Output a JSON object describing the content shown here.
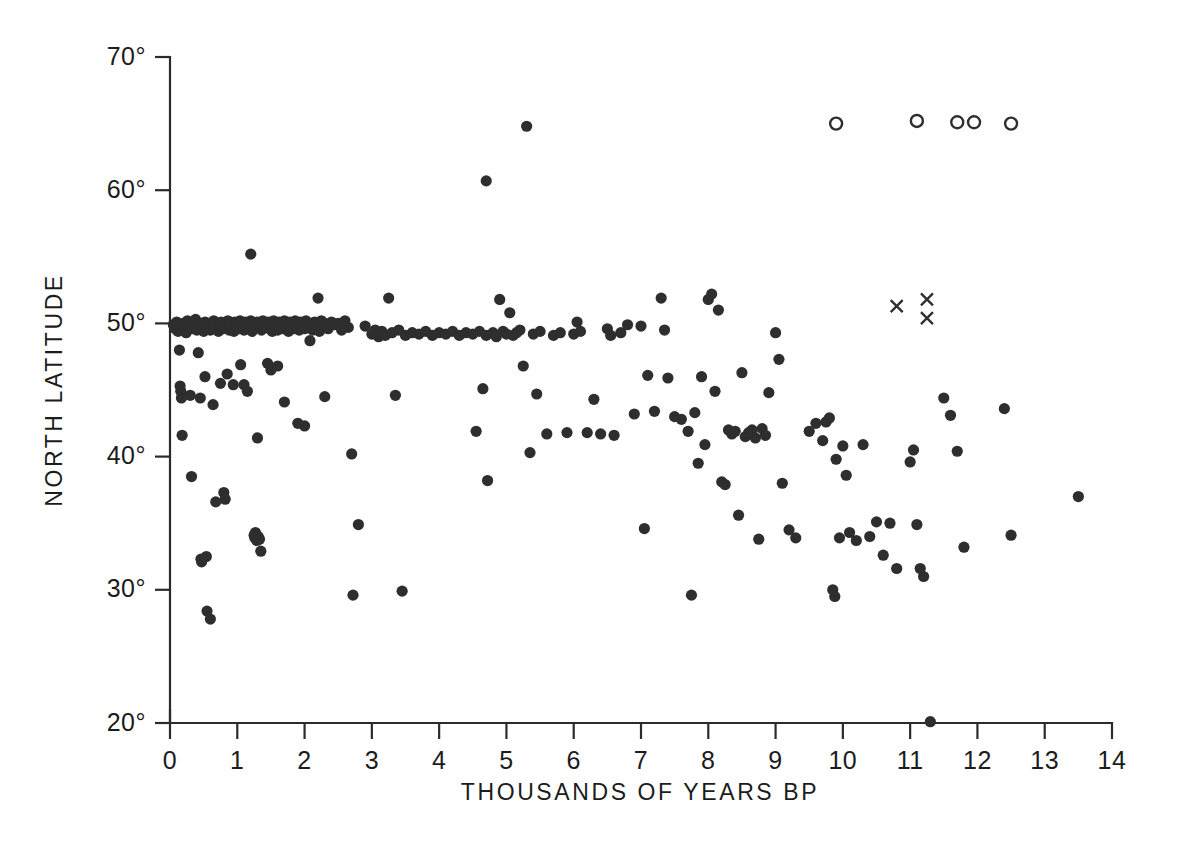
{
  "chart_data": {
    "type": "scatter",
    "title": "",
    "xlabel": "THOUSANDS OF YEARS BP",
    "ylabel": "NORTH LATITUDE",
    "xlim": [
      0,
      14
    ],
    "ylim": [
      20,
      70
    ],
    "xticks": [
      0,
      1,
      2,
      3,
      4,
      5,
      6,
      7,
      8,
      9,
      10,
      11,
      12,
      13,
      14
    ],
    "xticklabels": [
      "0",
      "1",
      "2",
      "3",
      "4",
      "5",
      "6",
      "7",
      "8",
      "9",
      "10",
      "11",
      "12",
      "13",
      "14"
    ],
    "yticks": [
      20,
      30,
      40,
      50,
      60,
      70
    ],
    "yticklabels": [
      "20°",
      "30°",
      "40°",
      "50°",
      "60°",
      "70°"
    ],
    "grid": false,
    "legend_position": "none",
    "marker_colors": {
      "filled": "#2e2e2e",
      "open": "#2e2e2e",
      "cross": "#2e2e2e"
    },
    "series": [
      {
        "name": "filled-circle",
        "marker": "filled-circle",
        "points": [
          [
            0.05,
            49.9
          ],
          [
            0.08,
            49.6
          ],
          [
            0.1,
            50.1
          ],
          [
            0.12,
            49.4
          ],
          [
            0.14,
            48.0
          ],
          [
            0.15,
            45.3
          ],
          [
            0.16,
            44.9
          ],
          [
            0.17,
            44.4
          ],
          [
            0.18,
            41.6
          ],
          [
            0.2,
            50.0
          ],
          [
            0.22,
            49.7
          ],
          [
            0.24,
            49.3
          ],
          [
            0.26,
            50.2
          ],
          [
            0.28,
            49.8
          ],
          [
            0.3,
            50.0
          ],
          [
            0.3,
            44.6
          ],
          [
            0.32,
            38.5
          ],
          [
            0.34,
            49.6
          ],
          [
            0.36,
            49.9
          ],
          [
            0.38,
            50.3
          ],
          [
            0.4,
            49.5
          ],
          [
            0.42,
            47.8
          ],
          [
            0.44,
            50.0
          ],
          [
            0.45,
            44.4
          ],
          [
            0.46,
            32.3
          ],
          [
            0.47,
            32.1
          ],
          [
            0.48,
            49.8
          ],
          [
            0.5,
            49.4
          ],
          [
            0.52,
            50.1
          ],
          [
            0.52,
            46.0
          ],
          [
            0.54,
            32.5
          ],
          [
            0.55,
            28.4
          ],
          [
            0.56,
            49.7
          ],
          [
            0.58,
            50.0
          ],
          [
            0.6,
            49.5
          ],
          [
            0.6,
            27.8
          ],
          [
            0.62,
            49.9
          ],
          [
            0.64,
            43.9
          ],
          [
            0.65,
            50.2
          ],
          [
            0.66,
            49.6
          ],
          [
            0.68,
            36.6
          ],
          [
            0.7,
            50.0
          ],
          [
            0.72,
            49.4
          ],
          [
            0.74,
            49.8
          ],
          [
            0.75,
            45.5
          ],
          [
            0.76,
            50.1
          ],
          [
            0.78,
            49.6
          ],
          [
            0.8,
            50.0
          ],
          [
            0.8,
            37.3
          ],
          [
            0.82,
            36.8
          ],
          [
            0.84,
            49.7
          ],
          [
            0.85,
            46.2
          ],
          [
            0.86,
            50.2
          ],
          [
            0.88,
            49.5
          ],
          [
            0.9,
            50.0
          ],
          [
            0.92,
            49.8
          ],
          [
            0.94,
            45.4
          ],
          [
            0.95,
            49.4
          ],
          [
            0.96,
            50.1
          ],
          [
            0.98,
            49.9
          ],
          [
            1.0,
            50.0
          ],
          [
            1.02,
            49.6
          ],
          [
            1.04,
            50.2
          ],
          [
            1.05,
            46.9
          ],
          [
            1.06,
            49.7
          ],
          [
            1.08,
            50.0
          ],
          [
            1.1,
            49.5
          ],
          [
            1.1,
            45.4
          ],
          [
            1.12,
            50.1
          ],
          [
            1.14,
            49.8
          ],
          [
            1.15,
            44.9
          ],
          [
            1.16,
            50.0
          ],
          [
            1.18,
            49.6
          ],
          [
            1.2,
            50.2
          ],
          [
            1.2,
            55.2
          ],
          [
            1.22,
            49.4
          ],
          [
            1.24,
            50.0
          ],
          [
            1.25,
            34.1
          ],
          [
            1.26,
            33.9
          ],
          [
            1.27,
            34.3
          ],
          [
            1.28,
            49.7
          ],
          [
            1.29,
            33.7
          ],
          [
            1.3,
            50.1
          ],
          [
            1.3,
            41.4
          ],
          [
            1.31,
            34.0
          ],
          [
            1.32,
            49.9
          ],
          [
            1.33,
            33.8
          ],
          [
            1.34,
            50.0
          ],
          [
            1.35,
            32.9
          ],
          [
            1.36,
            49.5
          ],
          [
            1.38,
            50.2
          ],
          [
            1.4,
            49.7
          ],
          [
            1.42,
            50.0
          ],
          [
            1.44,
            49.8
          ],
          [
            1.45,
            47.0
          ],
          [
            1.46,
            50.1
          ],
          [
            1.48,
            49.6
          ],
          [
            1.5,
            50.0
          ],
          [
            1.5,
            46.5
          ],
          [
            1.52,
            49.4
          ],
          [
            1.54,
            50.2
          ],
          [
            1.56,
            49.9
          ],
          [
            1.58,
            50.0
          ],
          [
            1.6,
            49.5
          ],
          [
            1.6,
            46.8
          ],
          [
            1.62,
            50.1
          ],
          [
            1.64,
            49.7
          ],
          [
            1.66,
            50.0
          ],
          [
            1.68,
            49.6
          ],
          [
            1.7,
            50.2
          ],
          [
            1.7,
            44.1
          ],
          [
            1.72,
            49.8
          ],
          [
            1.74,
            50.0
          ],
          [
            1.76,
            49.4
          ],
          [
            1.78,
            50.1
          ],
          [
            1.8,
            49.9
          ],
          [
            1.82,
            50.0
          ],
          [
            1.84,
            49.6
          ],
          [
            1.86,
            50.2
          ],
          [
            1.88,
            49.7
          ],
          [
            1.9,
            50.0
          ],
          [
            1.9,
            42.5
          ],
          [
            1.92,
            49.5
          ],
          [
            1.94,
            50.1
          ],
          [
            1.96,
            49.8
          ],
          [
            1.98,
            50.0
          ],
          [
            2.0,
            49.6
          ],
          [
            2.0,
            42.3
          ],
          [
            2.02,
            50.2
          ],
          [
            2.05,
            49.9
          ],
          [
            2.08,
            48.7
          ],
          [
            2.1,
            50.0
          ],
          [
            2.12,
            49.5
          ],
          [
            2.15,
            50.1
          ],
          [
            2.18,
            49.7
          ],
          [
            2.2,
            50.0
          ],
          [
            2.2,
            51.9
          ],
          [
            2.22,
            49.4
          ],
          [
            2.25,
            50.2
          ],
          [
            2.28,
            49.8
          ],
          [
            2.3,
            50.0
          ],
          [
            2.3,
            44.5
          ],
          [
            2.35,
            49.6
          ],
          [
            2.4,
            50.1
          ],
          [
            2.45,
            49.9
          ],
          [
            2.5,
            50.0
          ],
          [
            2.55,
            49.5
          ],
          [
            2.6,
            50.2
          ],
          [
            2.65,
            49.7
          ],
          [
            2.7,
            40.2
          ],
          [
            2.72,
            29.6
          ],
          [
            2.8,
            34.9
          ],
          [
            2.9,
            49.8
          ],
          [
            3.0,
            49.2
          ],
          [
            3.05,
            49.5
          ],
          [
            3.1,
            49.0
          ],
          [
            3.15,
            49.4
          ],
          [
            3.2,
            49.1
          ],
          [
            3.25,
            51.9
          ],
          [
            3.3,
            49.3
          ],
          [
            3.35,
            44.6
          ],
          [
            3.4,
            49.5
          ],
          [
            3.45,
            29.9
          ],
          [
            3.5,
            49.1
          ],
          [
            3.6,
            49.3
          ],
          [
            3.7,
            49.2
          ],
          [
            3.8,
            49.4
          ],
          [
            3.9,
            49.1
          ],
          [
            4.0,
            49.3
          ],
          [
            4.1,
            49.2
          ],
          [
            4.2,
            49.4
          ],
          [
            4.3,
            49.1
          ],
          [
            4.4,
            49.3
          ],
          [
            4.5,
            49.2
          ],
          [
            4.55,
            41.9
          ],
          [
            4.6,
            49.4
          ],
          [
            4.65,
            45.1
          ],
          [
            4.7,
            49.1
          ],
          [
            4.7,
            60.7
          ],
          [
            4.72,
            38.2
          ],
          [
            4.8,
            49.3
          ],
          [
            4.85,
            49.0
          ],
          [
            4.9,
            51.8
          ],
          [
            4.95,
            49.4
          ],
          [
            5.0,
            49.2
          ],
          [
            5.05,
            50.8
          ],
          [
            5.1,
            49.1
          ],
          [
            5.15,
            49.3
          ],
          [
            5.2,
            49.5
          ],
          [
            5.25,
            46.8
          ],
          [
            5.3,
            64.8
          ],
          [
            5.35,
            40.3
          ],
          [
            5.4,
            49.2
          ],
          [
            5.45,
            44.7
          ],
          [
            5.5,
            49.4
          ],
          [
            5.6,
            41.7
          ],
          [
            5.7,
            49.1
          ],
          [
            5.8,
            49.3
          ],
          [
            5.9,
            41.8
          ],
          [
            6.0,
            49.2
          ],
          [
            6.05,
            50.1
          ],
          [
            6.1,
            49.4
          ],
          [
            6.2,
            41.8
          ],
          [
            6.3,
            44.3
          ],
          [
            6.4,
            41.7
          ],
          [
            6.5,
            49.6
          ],
          [
            6.55,
            49.1
          ],
          [
            6.6,
            41.6
          ],
          [
            6.7,
            49.3
          ],
          [
            6.8,
            49.9
          ],
          [
            6.9,
            43.2
          ],
          [
            7.0,
            49.8
          ],
          [
            7.05,
            34.6
          ],
          [
            7.1,
            46.1
          ],
          [
            7.2,
            43.4
          ],
          [
            7.3,
            51.9
          ],
          [
            7.35,
            49.5
          ],
          [
            7.4,
            45.9
          ],
          [
            7.5,
            43.0
          ],
          [
            7.6,
            42.8
          ],
          [
            7.7,
            41.9
          ],
          [
            7.75,
            29.6
          ],
          [
            7.8,
            43.3
          ],
          [
            7.85,
            39.5
          ],
          [
            7.9,
            46.0
          ],
          [
            7.95,
            40.9
          ],
          [
            8.0,
            51.8
          ],
          [
            8.05,
            52.2
          ],
          [
            8.1,
            44.9
          ],
          [
            8.15,
            51.0
          ],
          [
            8.2,
            38.1
          ],
          [
            8.25,
            37.9
          ],
          [
            8.3,
            42.0
          ],
          [
            8.35,
            41.7
          ],
          [
            8.4,
            41.9
          ],
          [
            8.45,
            35.6
          ],
          [
            8.5,
            46.3
          ],
          [
            8.55,
            41.5
          ],
          [
            8.6,
            41.8
          ],
          [
            8.65,
            42.0
          ],
          [
            8.7,
            41.4
          ],
          [
            8.75,
            33.8
          ],
          [
            8.8,
            42.1
          ],
          [
            8.85,
            41.6
          ],
          [
            8.9,
            44.8
          ],
          [
            9.0,
            49.3
          ],
          [
            9.05,
            47.3
          ],
          [
            9.1,
            38.0
          ],
          [
            9.2,
            34.5
          ],
          [
            9.3,
            33.9
          ],
          [
            9.5,
            41.9
          ],
          [
            9.6,
            42.5
          ],
          [
            9.7,
            41.2
          ],
          [
            9.75,
            42.6
          ],
          [
            9.8,
            42.9
          ],
          [
            9.85,
            30.0
          ],
          [
            9.88,
            29.5
          ],
          [
            9.9,
            39.8
          ],
          [
            9.95,
            33.9
          ],
          [
            10.0,
            40.8
          ],
          [
            10.05,
            38.6
          ],
          [
            10.1,
            34.3
          ],
          [
            10.2,
            33.7
          ],
          [
            10.3,
            40.9
          ],
          [
            10.4,
            34.0
          ],
          [
            10.5,
            35.1
          ],
          [
            10.6,
            32.6
          ],
          [
            10.7,
            35.0
          ],
          [
            10.8,
            31.6
          ],
          [
            11.0,
            39.6
          ],
          [
            11.05,
            40.5
          ],
          [
            11.1,
            34.9
          ],
          [
            11.15,
            31.6
          ],
          [
            11.2,
            31.0
          ],
          [
            11.3,
            20.1
          ],
          [
            11.5,
            44.4
          ],
          [
            11.6,
            43.1
          ],
          [
            11.7,
            40.4
          ],
          [
            11.8,
            33.2
          ],
          [
            12.4,
            43.6
          ],
          [
            12.5,
            34.1
          ],
          [
            13.5,
            37.0
          ]
        ]
      },
      {
        "name": "open-circle",
        "marker": "open-circle",
        "points": [
          [
            9.9,
            65.0
          ],
          [
            11.1,
            65.2
          ],
          [
            11.7,
            65.1
          ],
          [
            11.95,
            65.1
          ],
          [
            12.5,
            65.0
          ]
        ]
      },
      {
        "name": "cross",
        "marker": "x",
        "points": [
          [
            10.8,
            51.3
          ],
          [
            11.25,
            51.8
          ],
          [
            11.25,
            50.4
          ]
        ]
      }
    ]
  }
}
